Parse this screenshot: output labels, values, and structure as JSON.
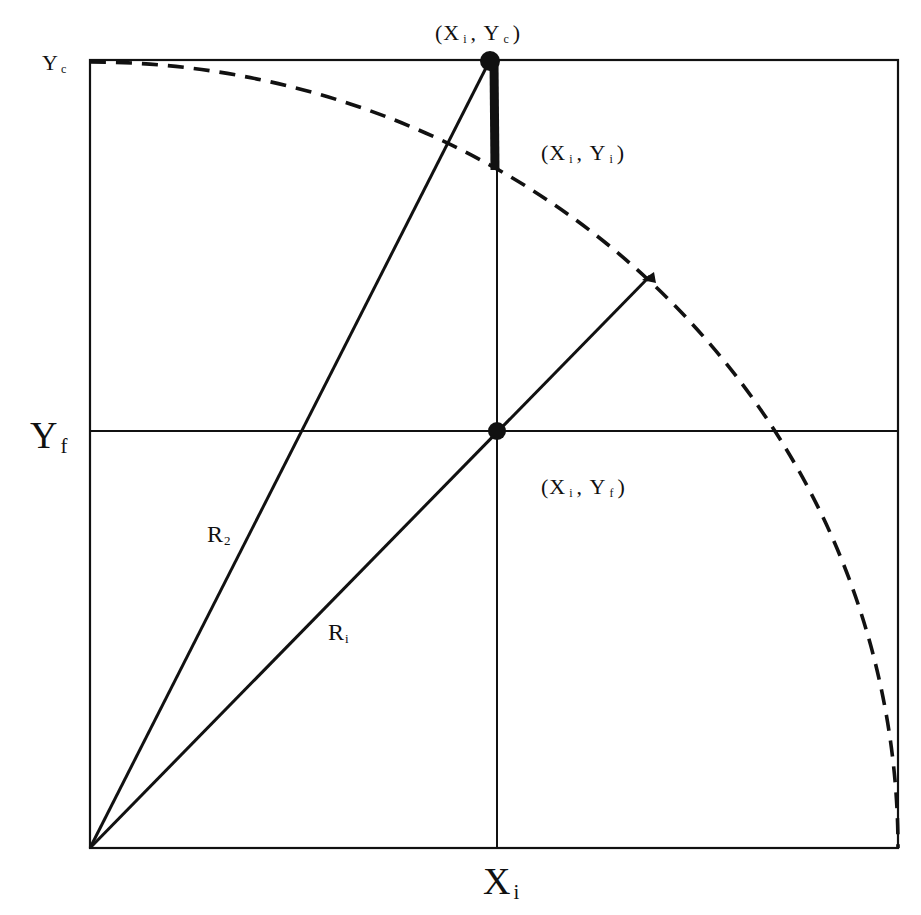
{
  "diagram": {
    "colors": {
      "stroke": "#111111",
      "background": "#ffffff"
    },
    "geometry": {
      "box": {
        "left": 90,
        "top": 60,
        "right": 898,
        "bottom": 848
      },
      "origin": {
        "x": 90,
        "y": 848
      },
      "arc_radius": 808,
      "xi": 497,
      "yf": 431,
      "yc": 60,
      "yi_on_arc": 168,
      "ri_arc_point": {
        "x": 648,
        "y": 277
      }
    },
    "labels": {
      "yc_axis": {
        "main": "Y",
        "sub": "c"
      },
      "yf_axis": {
        "main": "Y",
        "sub": "f"
      },
      "xi_axis": {
        "main": "X",
        "sub": "i"
      },
      "point_xi_yc": {
        "open": "(",
        "x": "X",
        "x_sub": "i",
        "sep": ",",
        "y": "Y",
        "y_sub": "c",
        "close": ")"
      },
      "point_xi_yi": {
        "open": "(",
        "x": "X",
        "x_sub": "i",
        "sep": ",",
        "y": "Y",
        "y_sub": "i",
        "close": ")"
      },
      "point_xi_yf": {
        "open": "(",
        "x": "X",
        "x_sub": "i",
        "sep": ",",
        "y": "Y",
        "y_sub": "f",
        "close": ")"
      },
      "r2": {
        "main": "R",
        "sub": "2"
      },
      "ri": {
        "main": "R",
        "sub": "i"
      }
    },
    "elements": [
      "outer-box",
      "dashed-quarter-circle-arc",
      "vertical-line-xi",
      "horizontal-line-yf",
      "radius-line-r2",
      "radius-line-ri",
      "thick-segment-yi-to-yc",
      "point-xi-yc",
      "point-xi-yf"
    ]
  }
}
